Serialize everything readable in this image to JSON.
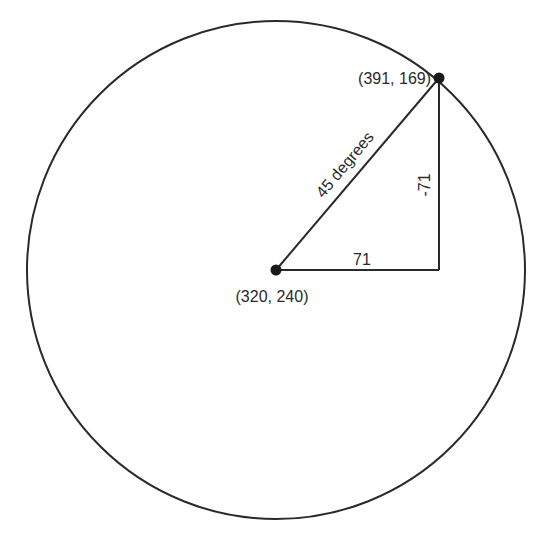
{
  "diagram": {
    "type": "circle-right-triangle",
    "colors": {
      "stroke": "#2a2a2a",
      "background": "#ffffff"
    },
    "circle": {
      "cx": 276,
      "cy": 270,
      "r": 249
    },
    "center_point": {
      "x": 276,
      "y": 270,
      "label": "(320, 240)"
    },
    "edge_point": {
      "x": 439,
      "y": 78,
      "label": "(391, 169)"
    },
    "corner_point": {
      "x": 439,
      "y": 270
    },
    "hypotenuse_label": "45 degrees",
    "horizontal_leg_label": "71",
    "vertical_leg_label": "-71"
  }
}
